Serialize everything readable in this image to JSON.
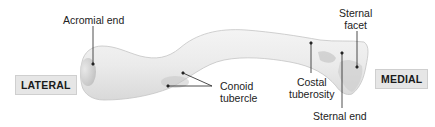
{
  "figure": {
    "orientation_labels": {
      "lateral": "LATERAL",
      "medial": "MEDIAL"
    },
    "annotations": [
      {
        "id": "acromial-end",
        "text": "Acromial end"
      },
      {
        "id": "conoid-tubercle",
        "text_lines": [
          "Conoid",
          "tubercle"
        ]
      },
      {
        "id": "costal-tuberosity",
        "text_lines": [
          "Costal",
          "tuberosity"
        ]
      },
      {
        "id": "sternal-facet",
        "text_lines": [
          "Sternal",
          "facet"
        ]
      },
      {
        "id": "sternal-end",
        "text": "Sternal end"
      }
    ],
    "colors": {
      "background": "#ffffff",
      "bone_fill": "#ededed",
      "bone_shadow": "#c8c8c8",
      "leader_line": "#222222",
      "label_box_fill": "#e6e6e6",
      "label_box_border": "#cfcfcf"
    }
  }
}
